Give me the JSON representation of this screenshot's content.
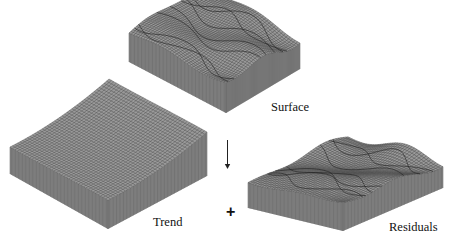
{
  "diagram": {
    "type": "surface-decomposition",
    "blocks": [
      {
        "id": "surface",
        "label": "Surface",
        "style": "rough-terrain"
      },
      {
        "id": "trend",
        "label": "Trend",
        "style": "smooth-saddle"
      },
      {
        "id": "residuals",
        "label": "Residuals",
        "style": "rough-terrain"
      }
    ],
    "connectors": [
      {
        "type": "arrow",
        "direction": "down",
        "from": "surface",
        "to": "trend+residuals"
      },
      {
        "type": "operator",
        "symbol": "+",
        "between": [
          "trend",
          "residuals"
        ]
      }
    ],
    "colors": {
      "wire": "#3a3a3a",
      "wall": "#8c8c8c",
      "wall_line": "#5a5a5a",
      "text": "#111111"
    }
  }
}
